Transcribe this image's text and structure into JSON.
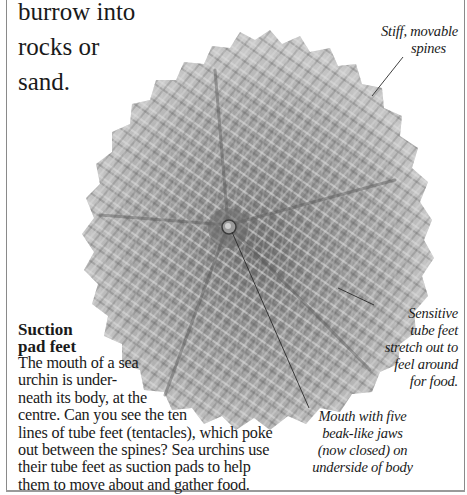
{
  "intro_text": {
    "lines": [
      "burrow into",
      "rocks or",
      "sand."
    ]
  },
  "section": {
    "heading_lines": [
      "Suction",
      "pad feet"
    ],
    "body_lines": [
      "The mouth of a sea",
      "urchin is under-",
      "neath its body, at the",
      "centre. Can you see the ten",
      "lines of tube feet (tentacles), which poke",
      "out between the spines? Sea urchins use",
      "their tube feet as suction pads to help",
      "them to move about and gather food."
    ]
  },
  "captions": {
    "spines": [
      "Stiff, movable",
      "spines"
    ],
    "tube_feet": [
      "Sensitive",
      "tube feet",
      "stretch out to",
      "feel around",
      "for food."
    ],
    "mouth": [
      "Mouth with five",
      "beak-like jaws",
      "(now closed) on",
      "underside of body"
    ]
  },
  "image": {
    "subject": "sea-urchin-underside-photo",
    "colors": {
      "spine_light": "#d4d4d4",
      "spine_mid": "#9c9c9c",
      "spine_dark": "#5a5a5a",
      "leader_line": "#2a2a2a",
      "text": "#1a1a1a",
      "border": "#8a8a8a"
    }
  }
}
